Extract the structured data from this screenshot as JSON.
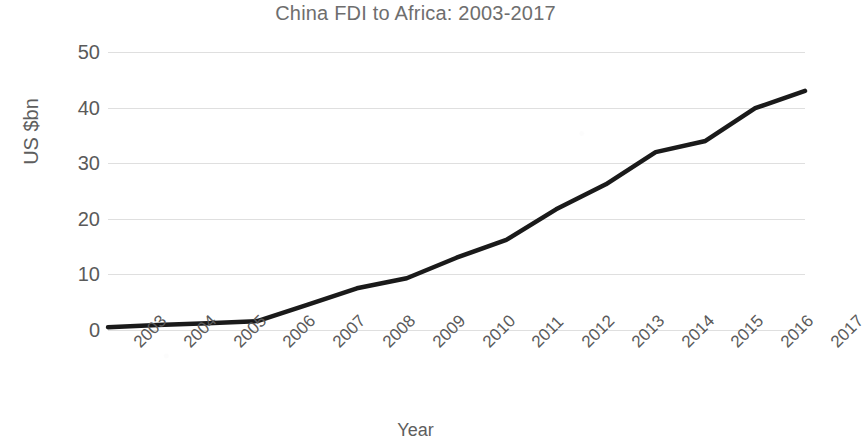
{
  "chart_data": {
    "type": "line",
    "title": "China FDI to Africa: 2003-2017",
    "xlabel": "Year",
    "ylabel": "US $bn",
    "categories": [
      "2003",
      "2004",
      "2005",
      "2006",
      "2007",
      "2008",
      "2009",
      "2010",
      "2011",
      "2012",
      "2013",
      "2014",
      "2015",
      "2016",
      "2017"
    ],
    "values": [
      0.5,
      0.9,
      1.2,
      1.6,
      4.5,
      7.5,
      9.3,
      13.0,
      16.2,
      21.7,
      26.2,
      32.0,
      34.0,
      39.9,
      43.0
    ],
    "series": [
      {
        "name": "China FDI stock to Africa",
        "values": [
          0.5,
          0.9,
          1.2,
          1.6,
          4.5,
          7.5,
          9.3,
          13.0,
          16.2,
          21.7,
          26.2,
          32.0,
          34.0,
          39.9,
          43.0
        ]
      }
    ],
    "ylim": [
      0,
      50
    ],
    "yticks": [
      0,
      10,
      20,
      30,
      40,
      50
    ],
    "ytick_labels": [
      "0",
      "10",
      "20",
      "30",
      "40",
      "50"
    ],
    "grid": "horizontal",
    "legend": "none",
    "line_color": "#1a1a1a",
    "grid_color": "#d9d9d9",
    "text_color": "#5a5a5a",
    "background": "#ffffff",
    "markers": "none"
  }
}
